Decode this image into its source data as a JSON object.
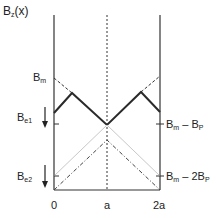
{
  "title": {
    "main": "B",
    "sub": "z",
    "rest": "(x)"
  },
  "labels": {
    "bm": {
      "main": "B",
      "sub": "m"
    },
    "be1": {
      "main": "B",
      "sub": "e1"
    },
    "be2": {
      "main": "B",
      "sub": "e2"
    },
    "right1": {
      "a": "B",
      "asub": "m",
      "mid": " – B",
      "bsub": "P"
    },
    "right2": {
      "a": "B",
      "asub": "m",
      "mid": " – 2B",
      "bsub": "P"
    }
  },
  "x_ticks": [
    "0",
    "a",
    "2a"
  ],
  "colors": {
    "line": "#2a2a2a",
    "light": "#c8c8c8"
  }
}
